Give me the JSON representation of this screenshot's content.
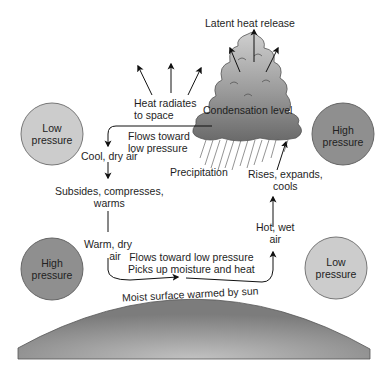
{
  "diagram": {
    "labels": {
      "latent_heat": "Latent heat release",
      "heat_radiates_1": "Heat radiates",
      "heat_radiates_2": "to space",
      "condensation": "Condensation level",
      "flows_toward_1": "Flows toward",
      "flows_toward_2": "low pressure",
      "cool_dry": "Cool, dry air",
      "precipitation": "Precipitation",
      "rises_1": "Rises, expands,",
      "rises_2": "cools",
      "subsides_1": "Subsides, compresses,",
      "subsides_2": "warms",
      "hot_wet_1": "Hot, wet",
      "hot_wet_2": "air",
      "warm_dry_1": "Warm, dry",
      "warm_dry_2": "air",
      "surface_flow_1": "Flows toward low pressure",
      "surface_flow_2": "Picks up moisture and heat",
      "moist_surface": "Moist surface warmed by sun"
    },
    "pressure_circles": [
      {
        "id": "top-left",
        "line1": "Low",
        "line2": "pressure",
        "fill": "#cccccc"
      },
      {
        "id": "top-right",
        "line1": "High",
        "line2": "pressure",
        "fill": "#8f8f8f"
      },
      {
        "id": "bottom-left",
        "line1": "High",
        "line2": "pressure",
        "fill": "#8f8f8f"
      },
      {
        "id": "bottom-right",
        "line1": "Low",
        "line2": "pressure",
        "fill": "#cccccc"
      }
    ],
    "colors": {
      "ground_dark": "#7a7a7a",
      "ground_light": "#bdbdbd",
      "cloud_top": "#c4c4c4",
      "cloud_bottom": "#6d6d6d",
      "arrow": "#111111"
    }
  }
}
